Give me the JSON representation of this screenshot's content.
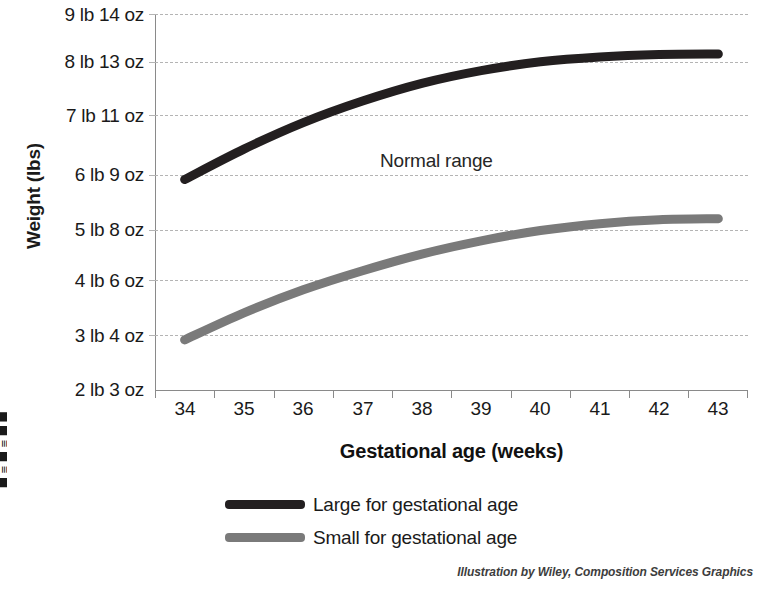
{
  "figure": {
    "credit": "Illustration by Wiley, Composition Services Graphics",
    "margin_fragment": "█ ≡ █ ≡ █ █"
  },
  "axes": {
    "y_title": "Weight (lbs)",
    "x_title": "Gestational age (weeks)",
    "y_ticklabels": [
      "9 lb 14 oz",
      "8 lb 13 oz",
      "7 lb 11 oz",
      "6 lb 9 oz",
      "5 lb 8 oz",
      "4 lb 6 oz",
      "3 lb 4 oz",
      "2 lb 3 oz"
    ],
    "x_ticklabels": [
      "34",
      "35",
      "36",
      "37",
      "38",
      "39",
      "40",
      "41",
      "42",
      "43"
    ]
  },
  "annotations": [
    {
      "text": "Normal range",
      "x_week": 38.3,
      "y_lbs": 7.3
    }
  ],
  "legend": {
    "position": "below-plot",
    "entries": [
      {
        "label": "Large for gestational age",
        "color": "#231f20"
      },
      {
        "label": "Small for gestational age",
        "color": "#7a7a7a"
      }
    ]
  },
  "chart_data": {
    "type": "line",
    "title": "",
    "subtitle": "",
    "xlabel": "Gestational age (weeks)",
    "ylabel": "Weight (lbs)",
    "grid": true,
    "xlim": [
      33.5,
      43.5
    ],
    "ylim": [
      2.1875,
      9.875
    ],
    "y_tick_values": [
      9.875,
      8.8125,
      7.6875,
      6.5625,
      5.5,
      4.375,
      3.25,
      2.1875
    ],
    "y_tick_labels": [
      "9 lb 14 oz",
      "8 lb 13 oz",
      "7 lb 11 oz",
      "6 lb 9 oz",
      "5 lb 8 oz",
      "4 lb 6 oz",
      "3 lb 4 oz",
      "2 lb 3 oz"
    ],
    "x": [
      34,
      35,
      36,
      37,
      38,
      39,
      40,
      41,
      42,
      43
    ],
    "series": [
      {
        "name": "Large for gestational age",
        "color": "#231f20",
        "values": [
          6.5,
          7.12,
          7.66,
          8.1,
          8.46,
          8.72,
          8.9,
          9.0,
          9.05,
          9.06
        ]
      },
      {
        "name": "Small for gestational age",
        "color": "#7a7a7a",
        "values": [
          3.23,
          3.78,
          4.25,
          4.64,
          4.98,
          5.25,
          5.46,
          5.6,
          5.68,
          5.7
        ]
      }
    ],
    "annotations": [
      {
        "text": "Normal range",
        "x": 38.3,
        "y": 7.3
      }
    ]
  }
}
